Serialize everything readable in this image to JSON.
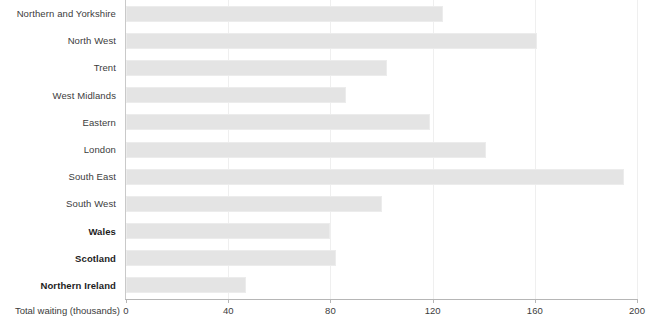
{
  "chart_data": {
    "type": "bar",
    "orientation": "horizontal",
    "title": "",
    "xlabel": "Total waiting (thousands)",
    "ylabel": "",
    "xlim": [
      0,
      200
    ],
    "xticks": [
      0,
      40,
      80,
      120,
      160,
      200
    ],
    "grid": true,
    "legend": false,
    "bar_color": "#e4e4e4",
    "bar_edge_color": "#ececec",
    "axis_color": "#b6b6b6",
    "gridline_color": "#efefef",
    "categories": [
      "Northern and Yorkshire",
      "North West",
      "Trent",
      "West Midlands",
      "Eastern",
      "London",
      "South East",
      "South West",
      "Wales",
      "Scotland",
      "Northern Ireland"
    ],
    "values": [
      124,
      161,
      102,
      86,
      119,
      141,
      195,
      100,
      80,
      82,
      47
    ],
    "bold_categories": [
      "Wales",
      "Scotland",
      "Northern Ireland"
    ]
  }
}
